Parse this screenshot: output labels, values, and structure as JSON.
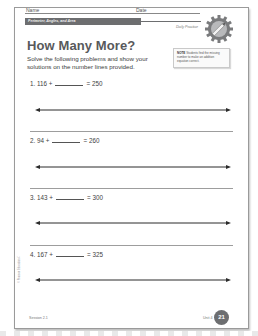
{
  "header": {
    "name_label": "Name",
    "date_label": "Date",
    "unit_title": "Perimeter, Angles, and Area",
    "daily_practice_label": "Daily Practice",
    "badge_icon": "pencil-gear-icon"
  },
  "worksheet": {
    "title": "How Many More?",
    "instructions": "Solve the following problems and show your solutions on the number lines provided.",
    "note": {
      "label": "NOTE",
      "text": "Students find the missing number to make an addition equation correct."
    },
    "problems": [
      {
        "number": "1.",
        "addend": "116 +",
        "result": "= 250"
      },
      {
        "number": "2.",
        "addend": "94 +",
        "result": "= 260"
      },
      {
        "number": "3.",
        "addend": "143 +",
        "result": "= 300"
      },
      {
        "number": "4.",
        "addend": "167 +",
        "result": "= 325"
      }
    ]
  },
  "footer": {
    "session": "Session 2.1",
    "unit": "Unit 4",
    "page_number": "21",
    "copyright": "© Pearson Education 4"
  },
  "colors": {
    "bar_gray": "#6d6e70",
    "title_gray": "#58595b",
    "line_gray": "#9d9d9d"
  }
}
